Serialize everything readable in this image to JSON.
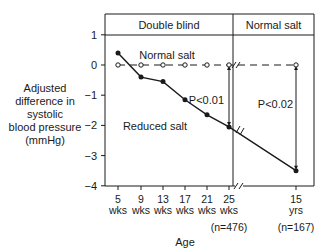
{
  "chart_data": {
    "type": "line",
    "title": "",
    "xlabel": "Age",
    "ylabel": "Adjusted difference in systolic blood pressure (mmHg)",
    "ylim": [
      -4,
      1
    ],
    "yticks": [
      "1",
      "0",
      "-1",
      "-2",
      "-3",
      "-4"
    ],
    "categories": [
      "5 wks",
      "9 wks",
      "13 wks",
      "17 wks",
      "21 wks",
      "25 wks",
      "15 yrs"
    ],
    "x_tick_top": [
      "5",
      "9",
      "13",
      "17",
      "21",
      "25",
      "15"
    ],
    "x_tick_bottom": [
      "wks",
      "wks",
      "wks",
      "wks",
      "wks",
      "wks",
      "yrs"
    ],
    "sample_sizes": [
      {
        "at": "25 wks",
        "label": "(n=476)"
      },
      {
        "at": "15 yrs",
        "label": "(n=167)"
      }
    ],
    "panels": [
      "Double blind",
      "Normal salt"
    ],
    "series": [
      {
        "name": "Normal salt",
        "style": "dashed, open circles",
        "values": [
          0,
          0,
          0,
          0,
          0,
          0,
          0
        ]
      },
      {
        "name": "Reduced salt",
        "style": "solid, filled circles",
        "values": [
          0.4,
          -0.4,
          -0.55,
          -1.15,
          -1.65,
          -2.05,
          -3.5
        ]
      }
    ],
    "annotations": [
      {
        "text": "P<0.01",
        "at": "25 wks"
      },
      {
        "text": "P<0.02",
        "at": "15 yrs"
      }
    ],
    "grid": false,
    "axis_break": "between 25 wks and 15 yrs"
  },
  "labels": {
    "ylabel_lines": [
      "Adjusted",
      "difference in",
      "systolic",
      "blood pressure",
      "(mmHg)"
    ],
    "xlabel": "Age",
    "panel_left": "Double blind",
    "panel_right": "Normal salt",
    "series_normal": "Normal salt",
    "series_reduced": "Reduced salt",
    "p1": "P<0.01",
    "p2": "P<0.02",
    "n1": "(n=476)",
    "n2": "(n=167)"
  }
}
